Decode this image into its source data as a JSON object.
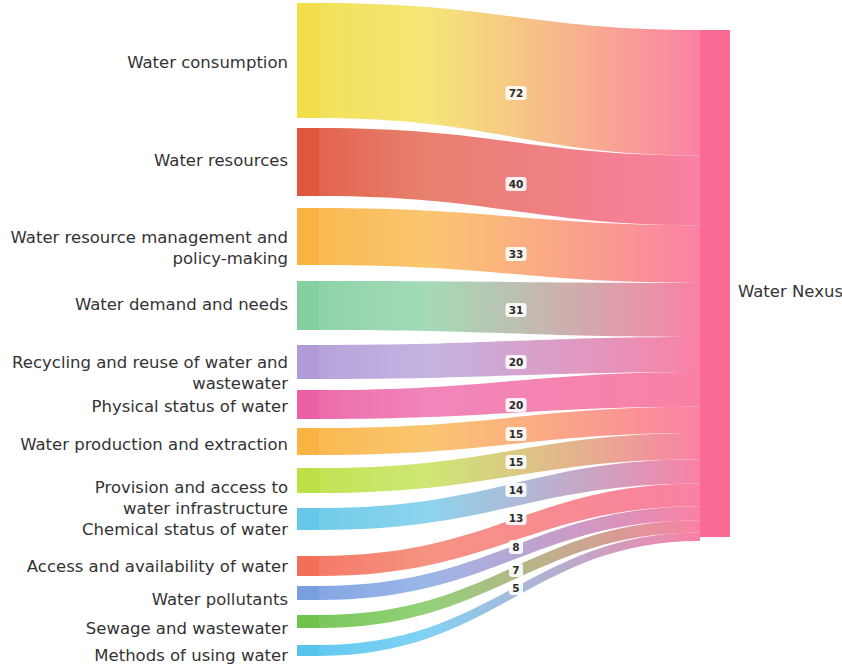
{
  "chart_data": {
    "type": "sankey",
    "title": "",
    "orientation": "left-to-right",
    "target_node": {
      "label": "Water Nexus",
      "color": "#F96A94",
      "total": 293
    },
    "sources": [
      {
        "label": "Water consumption",
        "value": 72,
        "value_text": "72",
        "color": "#F2DE4B"
      },
      {
        "label": "Water resources",
        "value": 40,
        "value_text": "40",
        "color": "#E0573F"
      },
      {
        "label": "Water resource management and policy-making",
        "value": 33,
        "value_text": "33",
        "color": "#F9B342"
      },
      {
        "label": "Water demand and needs",
        "value": 31,
        "value_text": "31",
        "color": "#85CFA0"
      },
      {
        "label": "Recycling and reuse of water and wastewater",
        "value": 20,
        "value_text": "20",
        "color": "#B09BD8"
      },
      {
        "label": "Physical status of water",
        "value": 20,
        "value_text": "20",
        "color": "#EB5FA4"
      },
      {
        "label": "Water production and extraction",
        "value": 15,
        "value_text": "15",
        "color": "#F9B342"
      },
      {
        "label": "Provision and access to water infrastructure",
        "value": 15,
        "value_text": "15",
        "color": "#BDE048"
      },
      {
        "label": "Chemical status of water",
        "value": 14,
        "value_text": "14",
        "color": "#66C7E8"
      },
      {
        "label": "Access and availability of water",
        "value": 13,
        "value_text": "13",
        "color": "#F2705A"
      },
      {
        "label": "Water pollutants",
        "value": 8,
        "value_text": "8",
        "color": "#7A9FE0"
      },
      {
        "label": "Sewage and wastewater",
        "value": 7,
        "value_text": "7",
        "color": "#6FC34D"
      },
      {
        "label": "Methods of using water",
        "value": 5,
        "value_text": "5",
        "color": "#57C4EE"
      }
    ],
    "categories": [
      "Water consumption",
      "Water resources",
      "Water resource management and policy-making",
      "Water demand and needs",
      "Recycling and reuse of water and wastewater",
      "Physical status of water",
      "Water production and extraction",
      "Provision and access to water infrastructure",
      "Chemical status of water",
      "Access and availability of water",
      "Water pollutants",
      "Sewage and wastewater",
      "Methods of using water"
    ],
    "values": [
      72,
      40,
      33,
      31,
      20,
      20,
      15,
      15,
      14,
      13,
      8,
      7,
      5
    ],
    "xlabel": "",
    "ylabel": "",
    "legend": "none",
    "grid": false
  },
  "labels": {
    "left": [
      {
        "lines": [
          "Water consumption"
        ]
      },
      {
        "lines": [
          "Water resources"
        ]
      },
      {
        "lines": [
          "Water resource management and",
          "policy-making"
        ]
      },
      {
        "lines": [
          "Water demand and needs"
        ]
      },
      {
        "lines": [
          "Recycling and reuse of water and",
          "wastewater"
        ]
      },
      {
        "lines": [
          "Physical status of water"
        ]
      },
      {
        "lines": [
          "Water production and extraction"
        ]
      },
      {
        "lines": [
          "Provision and access to",
          "water infrastructure"
        ]
      },
      {
        "lines": [
          "Chemical status of water"
        ]
      },
      {
        "lines": [
          "Access and availability of water"
        ]
      },
      {
        "lines": [
          "Water pollutants"
        ]
      },
      {
        "lines": [
          "Sewage and wastewater"
        ]
      },
      {
        "lines": [
          "Methods of using water"
        ]
      }
    ],
    "right": "Water Nexus"
  },
  "geometry": {
    "source_node_x": 297,
    "source_node_width": 22,
    "target_node_x": 700,
    "target_node_width": 30,
    "target_node_top": 30,
    "target_node_bottom": 537,
    "label_right_edge": 288,
    "value_label_x": 516,
    "source_bars": [
      {
        "top": 3,
        "bottom": 118
      },
      {
        "top": 128,
        "bottom": 196
      },
      {
        "top": 208,
        "bottom": 265
      },
      {
        "top": 281,
        "bottom": 330
      },
      {
        "top": 345,
        "bottom": 379
      },
      {
        "top": 390,
        "bottom": 419
      },
      {
        "top": 428,
        "bottom": 455
      },
      {
        "top": 468,
        "bottom": 493
      },
      {
        "top": 508,
        "bottom": 530
      },
      {
        "top": 556,
        "bottom": 576
      },
      {
        "top": 586,
        "bottom": 600
      },
      {
        "top": 615,
        "bottom": 628
      },
      {
        "top": 645,
        "bottom": 656
      }
    ],
    "target_slots": [
      {
        "top": 30,
        "bottom": 155.5
      },
      {
        "top": 155.5,
        "bottom": 225.3
      },
      {
        "top": 225.3,
        "bottom": 282.9
      },
      {
        "top": 282.9,
        "bottom": 337.0
      },
      {
        "top": 337.0,
        "bottom": 371.9
      },
      {
        "top": 371.9,
        "bottom": 406.8
      },
      {
        "top": 406.8,
        "bottom": 433.0
      },
      {
        "top": 433.0,
        "bottom": 459.2
      },
      {
        "top": 459.2,
        "bottom": 483.6
      },
      {
        "top": 483.6,
        "bottom": 506.3
      },
      {
        "top": 506.3,
        "bottom": 520.2
      },
      {
        "top": 520.2,
        "bottom": 532.4
      },
      {
        "top": 532.4,
        "bottom": 541.1
      }
    ],
    "label_rows": [
      {
        "baseline_start": 68
      },
      {
        "baseline_start": 166
      },
      {
        "baseline_start": 243
      },
      {
        "baseline_start": 310
      },
      {
        "baseline_start": 368
      },
      {
        "baseline_start": 412
      },
      {
        "baseline_start": 450
      },
      {
        "baseline_start": 493
      },
      {
        "baseline_start": 535
      },
      {
        "baseline_start": 572
      },
      {
        "baseline_start": 605
      },
      {
        "baseline_start": 634
      },
      {
        "baseline_start": 661
      }
    ],
    "value_label_y": [
      95,
      186,
      256,
      312,
      364,
      407,
      436,
      464,
      492,
      520,
      549,
      572,
      590
    ]
  }
}
